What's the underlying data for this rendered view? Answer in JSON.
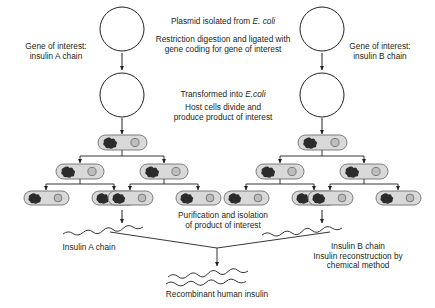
{
  "diagram": {
    "colors": {
      "stroke": "#231f20",
      "text": "#231f20",
      "cell_fill": "#d9d9d9",
      "cell_stroke": "#6f6f6f",
      "chromosome": "#2b2b2b",
      "plasmid_fill": "#bdbdbd",
      "plasmid_stroke": "#6f6f6f",
      "background": "#ffffff"
    },
    "labels": {
      "gene_left_line1": "Gene of interest:",
      "gene_left_line2": "insulin A chain",
      "gene_right_line1": "Gene of interest:",
      "gene_right_line2": "insulin B chain",
      "plasmid_isolated_pre": "Plasmid isolated from ",
      "plasmid_isolated_italic": "E. coli",
      "restriction_line1": "Restriction digestion and ligated with",
      "restriction_line2": "gene coding for gene of interest",
      "transformed_pre": "Transformed into ",
      "transformed_italic": "E.coli",
      "host_line1": "Host cells divide and",
      "host_line2": "produce product of interest",
      "purification_line1": "Purification and isolation",
      "purification_line2": "of product of interest",
      "insulin_a_chain": "Insulin A chain",
      "insulin_b_chain": "Insulin B chain",
      "reconstruction_line1": "Insulin reconstruction by",
      "reconstruction_line2": "chemical method",
      "recombinant": "Recombinant human insulin"
    },
    "stages": [
      {
        "name": "empty-plasmid",
        "count": 2,
        "description": "Empty circular plasmid isolated from E. coli"
      },
      {
        "name": "recombinant-plasmid",
        "count": 2,
        "description": "Plasmid ligated with gene of interest"
      },
      {
        "name": "transformed-cell",
        "count": 2,
        "description": "Single transformed E. coli host cell"
      },
      {
        "name": "divided-cells-row1",
        "count": 4,
        "description": "Host cells after first division"
      },
      {
        "name": "divided-cells-row2",
        "count": 8,
        "description": "Host cells after second division"
      },
      {
        "name": "protein-chain",
        "count": 2,
        "description": "Purified insulin A chain and insulin B chain"
      },
      {
        "name": "recombinant-insulin",
        "count": 1,
        "description": "Two chains joined into recombinant human insulin"
      }
    ]
  }
}
